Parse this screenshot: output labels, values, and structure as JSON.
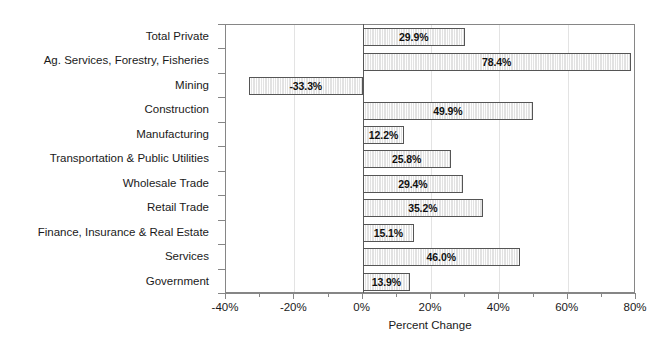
{
  "chart_data": {
    "type": "bar",
    "orientation": "horizontal",
    "title": "",
    "xlabel": "Percent Change",
    "ylabel": "",
    "xlim": [
      -40,
      80
    ],
    "xticks": [
      -40,
      -20,
      0,
      20,
      40,
      60,
      80
    ],
    "xtick_labels": [
      "-40%",
      "-20%",
      "0%",
      "20%",
      "40%",
      "60%",
      "80%"
    ],
    "minor_xticks": [
      -30,
      -10,
      10,
      30,
      50,
      70
    ],
    "grid": true,
    "grid_axis": "x",
    "legend": false,
    "categories": [
      "Total Private",
      "Ag. Services, Forestry, Fisheries",
      "Mining",
      "Construction",
      "Manufacturing",
      "Transportation & Public Utilities",
      "Wholesale Trade",
      "Retail Trade",
      "Finance, Insurance & Real Estate",
      "Services",
      "Government"
    ],
    "values": [
      29.9,
      78.4,
      -33.3,
      49.9,
      12.2,
      25.8,
      29.4,
      35.2,
      15.1,
      46.0,
      13.9
    ],
    "value_labels": [
      "29.9%",
      "78.4%",
      "-33.3%",
      "49.9%",
      "12.2%",
      "25.8%",
      "29.4%",
      "35.2%",
      "15.1%",
      "46.0%",
      "13.9%"
    ],
    "colors": {
      "bar_fill": "#e2e2e2",
      "bar_border": "#555555",
      "axis": "#868686",
      "gridline": "#e3e3e3",
      "text": "#1a1a1a",
      "background": "#ffffff"
    }
  }
}
